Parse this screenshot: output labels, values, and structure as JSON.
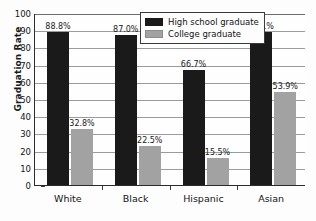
{
  "chart_data": {
    "type": "bar",
    "title": "",
    "xlabel": "",
    "ylabel": "Graduation Rate",
    "ylim": [
      0,
      100
    ],
    "ytick_step": 10,
    "grid": true,
    "legend_position": "top-center",
    "categories": [
      "White",
      "Black",
      "Hispanic",
      "Asian"
    ],
    "series": [
      {
        "name": "High school graduate",
        "color": "#1a1a1a",
        "values": [
          88.8,
          87.0,
          66.7,
          89.1
        ],
        "labels": [
          "88.8%",
          "87.0%",
          "66.7%",
          "89.1%"
        ]
      },
      {
        "name": "College graduate",
        "color": "#a2a2a2",
        "values": [
          32.8,
          22.5,
          15.5,
          53.9
        ],
        "labels": [
          "32.8%",
          "22.5%",
          "15.5%",
          "53.9%"
        ]
      }
    ],
    "yticks": [
      {
        "value": 100,
        "label": "100"
      },
      {
        "value": 90,
        "label": "90"
      },
      {
        "value": 80,
        "label": "80"
      },
      {
        "value": 70,
        "label": "70"
      },
      {
        "value": 60,
        "label": "60"
      },
      {
        "value": 50,
        "label": "50"
      },
      {
        "value": 40,
        "label": "40"
      },
      {
        "value": 30,
        "label": "30"
      },
      {
        "value": 20,
        "label": "20"
      },
      {
        "value": 10,
        "label": "10"
      },
      {
        "value": 0,
        "label": "0"
      }
    ]
  },
  "legend": {
    "items": [
      {
        "label": "High school graduate"
      },
      {
        "label": "College graduate"
      }
    ]
  }
}
